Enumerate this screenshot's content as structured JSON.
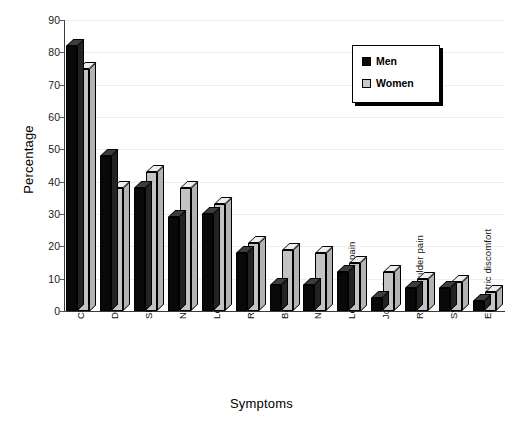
{
  "chart_data": {
    "type": "bar",
    "title": "",
    "xlabel": "Symptoms",
    "ylabel": "Percentage",
    "ylim": [
      0,
      90
    ],
    "yticks": [
      0,
      10,
      20,
      30,
      40,
      50,
      60,
      70,
      80,
      90
    ],
    "grid": true,
    "legend_position": "top-right",
    "categories": [
      "Chest pain",
      "Diaphoresis",
      "Shortness of breath",
      "Nausea",
      "Left arm pain",
      "Right arm pain",
      "Back pain",
      "Neck pain",
      "Left shoulder pain",
      "Joint pain",
      "Right shoulder pain",
      "Syncope",
      "Epigastric discomfort"
    ],
    "series": [
      {
        "name": "Men",
        "color": "#090909",
        "values": [
          82,
          48,
          38,
          29,
          30,
          18,
          8,
          8,
          12,
          4,
          7,
          7,
          3
        ]
      },
      {
        "name": "Women",
        "color": "#c3c3c3",
        "values": [
          75,
          38,
          43,
          38,
          33,
          21,
          19,
          18,
          15,
          12,
          10,
          9,
          6
        ]
      }
    ]
  },
  "legend": {
    "items": [
      {
        "label": "Men",
        "swatch": "men"
      },
      {
        "label": "Women",
        "swatch": "women"
      }
    ]
  },
  "axes": {
    "y_title": "Percentage",
    "x_title": "Symptoms"
  }
}
